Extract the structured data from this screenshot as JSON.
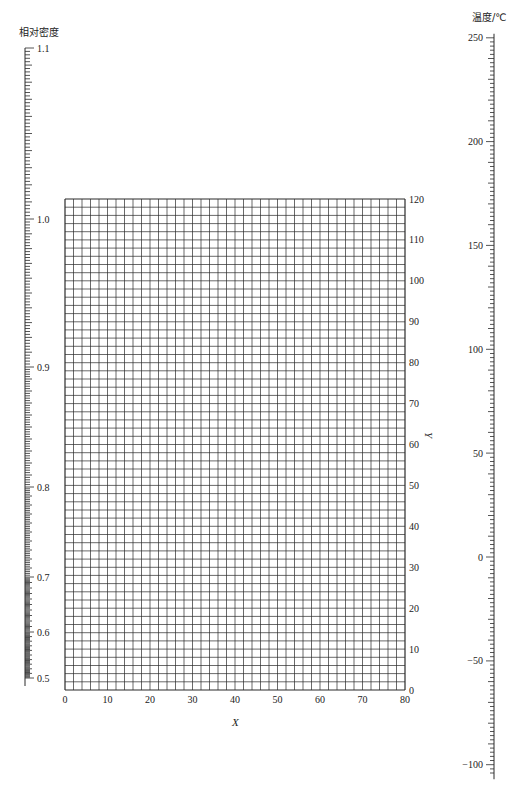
{
  "chart_data": {
    "type": "nomogram",
    "title": "",
    "components": [
      {
        "name": "density-scale",
        "label": "相对密度",
        "orientation": "vertical",
        "tick_labels": [
          "1.1",
          "1.0",
          "0.9",
          "0.8",
          "0.7",
          "0.6",
          "0.5"
        ],
        "values": [
          1.1,
          1.0,
          0.9,
          0.8,
          0.7,
          0.6,
          0.5
        ],
        "pixel_y": [
          48,
          219,
          367,
          487,
          577,
          632,
          678
        ],
        "minor_step": 0.002,
        "medium_step": 0.01,
        "scale": "nonlinear"
      },
      {
        "name": "xy-grid",
        "type": "grid",
        "xlabel": "X",
        "ylabel": "Y",
        "xlim": [
          0,
          80
        ],
        "ylim": [
          0,
          120
        ],
        "x_ticks": [
          0,
          10,
          20,
          30,
          40,
          50,
          60,
          70,
          80
        ],
        "y_ticks": [
          0,
          10,
          20,
          30,
          40,
          50,
          60,
          70,
          80,
          90,
          100,
          110,
          120
        ],
        "x_grid_step": 2,
        "y_grid_step": 2,
        "grid": true
      },
      {
        "name": "temperature-scale",
        "label": "温度/℃",
        "orientation": "vertical",
        "tick_labels": [
          "250",
          "200",
          "150",
          "100",
          "50",
          "0",
          "−50",
          "−100"
        ],
        "values": [
          250,
          200,
          150,
          100,
          50,
          0,
          -50,
          -100
        ],
        "range": [
          -107,
          250
        ],
        "minor_step": 2,
        "scale": "linear"
      }
    ]
  },
  "labels": {
    "density_title": "相对密度",
    "temperature_title": "温度/℃",
    "x_axis_title": "X",
    "y_axis_title": "Y"
  },
  "colors": {
    "line": "#2a2a2a",
    "text": "#222222",
    "background": "#ffffff"
  }
}
